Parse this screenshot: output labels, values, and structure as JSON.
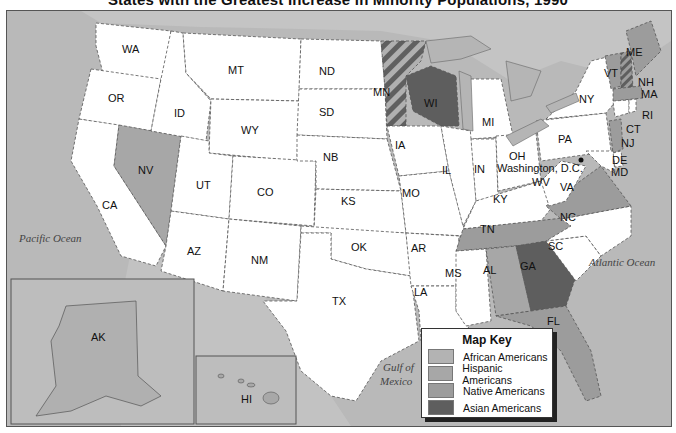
{
  "title": "States with the Greatest Increase in Minority Populations, 1990",
  "colors": {
    "water": "#b9b9b9",
    "land_default": "#ffffff",
    "african_americans": "#b3b3b3",
    "hispanic_americans": "#a7a7a7",
    "native_americans": "#9c9c9c",
    "asian_americans": "#5e5e5e"
  },
  "key": {
    "title": "Map Key",
    "items": [
      {
        "label": "African Americans",
        "color": "#b3b3b3"
      },
      {
        "label": "Hispanic Americans",
        "color": "#a7a7a7"
      },
      {
        "label": "Native Americans",
        "color": "#9c9c9c"
      },
      {
        "label": "Asian Americans",
        "color": "#5e5e5e"
      }
    ]
  },
  "water_labels": {
    "pacific": "Pacific Ocean",
    "atlantic": "Atlantic Ocean",
    "gulf_line1": "Gulf of",
    "gulf_line2": "Mexico"
  },
  "capital_label": "Washington, D.C.",
  "states": {
    "WA": "WA",
    "OR": "OR",
    "CA": "CA",
    "NV": "NV",
    "ID": "ID",
    "MT": "MT",
    "WY": "WY",
    "UT": "UT",
    "AZ": "AZ",
    "CO": "CO",
    "NM": "NM",
    "ND": "ND",
    "SD": "SD",
    "NB": "NB",
    "KS": "KS",
    "OK": "OK",
    "TX": "TX",
    "MN": "MN",
    "IA": "IA",
    "MO": "MO",
    "AR": "AR",
    "LA": "LA",
    "WI": "WI",
    "IL": "IL",
    "MI": "MI",
    "IN": "IN",
    "OH": "OH",
    "KY": "KY",
    "TN": "TN",
    "MS": "MS",
    "AL": "AL",
    "GA": "GA",
    "FL": "FL",
    "SC": "SC",
    "NC": "NC",
    "VA": "VA",
    "WV": "WV",
    "PA": "PA",
    "NY": "NY",
    "VT": "VT",
    "NH": "NH",
    "ME": "ME",
    "MA": "MA",
    "RI": "RI",
    "CT": "CT",
    "NJ": "NJ",
    "DE": "DE",
    "MD": "MD",
    "AK": "AK",
    "HI": "HI"
  },
  "state_categories": {
    "NV": "Hispanic Americans",
    "MN": "Asian Americans / Native Americans (striped)",
    "WI": "Asian Americans",
    "GA": "Asian Americans",
    "TN": "Native Americans",
    "AL": "Hispanic Americans",
    "FL": "Native Americans",
    "VA": "Native Americans",
    "ME": "Native Americans",
    "VT": "Native Americans",
    "NH": "Native Americans / Asian Americans (striped)",
    "MA": "Native Americans",
    "NJ": "Native Americans",
    "AK": "African Americans"
  }
}
